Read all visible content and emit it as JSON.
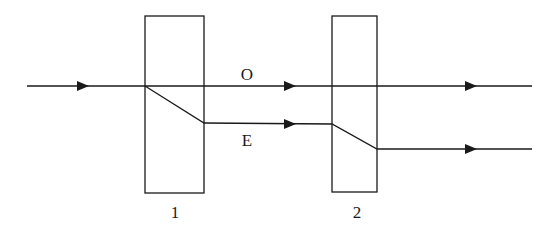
{
  "diagram": {
    "labels": {
      "ordinary": "O",
      "extraordinary": "E",
      "plate1": "1",
      "plate2": "2"
    },
    "colors": {
      "line": "#1a1a1a",
      "background": "#ffffff"
    },
    "plates": [
      {
        "id": "1",
        "x": 145,
        "y": 16,
        "width": 59,
        "height": 177
      },
      {
        "id": "2",
        "x": 332,
        "y": 16,
        "width": 45,
        "height": 176
      }
    ],
    "rays": {
      "incident": {
        "from": [
          27,
          86
        ],
        "to": [
          145,
          86
        ]
      },
      "ordinary": {
        "from": [
          145,
          86
        ],
        "to": [
          532,
          86
        ]
      },
      "extraordinary": [
        [
          145,
          86
        ],
        [
          204,
          123
        ],
        [
          332,
          124
        ],
        [
          377,
          149
        ],
        [
          532,
          149
        ]
      ]
    }
  }
}
